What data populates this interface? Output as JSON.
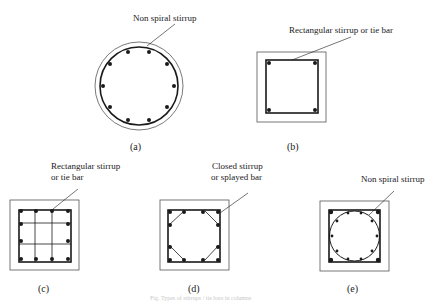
{
  "figure": {
    "caption": "Fig. Types of stirrups / tie bars in columns",
    "panels": [
      {
        "id": "a",
        "label": "(a)",
        "annotation_lines": [
          "Non spiral stirrup"
        ],
        "shape": "circular section, 12 longitudinal bars, circular non-spiral stirrup"
      },
      {
        "id": "b",
        "label": "(b)",
        "annotation_lines": [
          "Rectangular stirrup or tie bar"
        ],
        "shape": "square section, 4 corner bars, rectangular stirrup"
      },
      {
        "id": "c",
        "label": "(c)",
        "annotation_lines": [
          "Rectangular stirrup",
          "or tie bar"
        ],
        "shape": "square section, 12 bars, rectangular stirrup with 2x2 internal ties"
      },
      {
        "id": "d",
        "label": "(d)",
        "annotation_lines": [
          "Closed stirrup",
          "or splayed bar"
        ],
        "shape": "square section, 12 bars, closed stirrup with splayed corner bars"
      },
      {
        "id": "e",
        "label": "(e)",
        "annotation_lines": [
          "Non spiral stirrup"
        ],
        "shape": "square section, 4 corner bars plus circular non-spiral stirrup with 12 bars"
      }
    ]
  },
  "colors": {
    "line": "#1a1a1a",
    "outline": "#555555",
    "background": "#ffffff"
  }
}
